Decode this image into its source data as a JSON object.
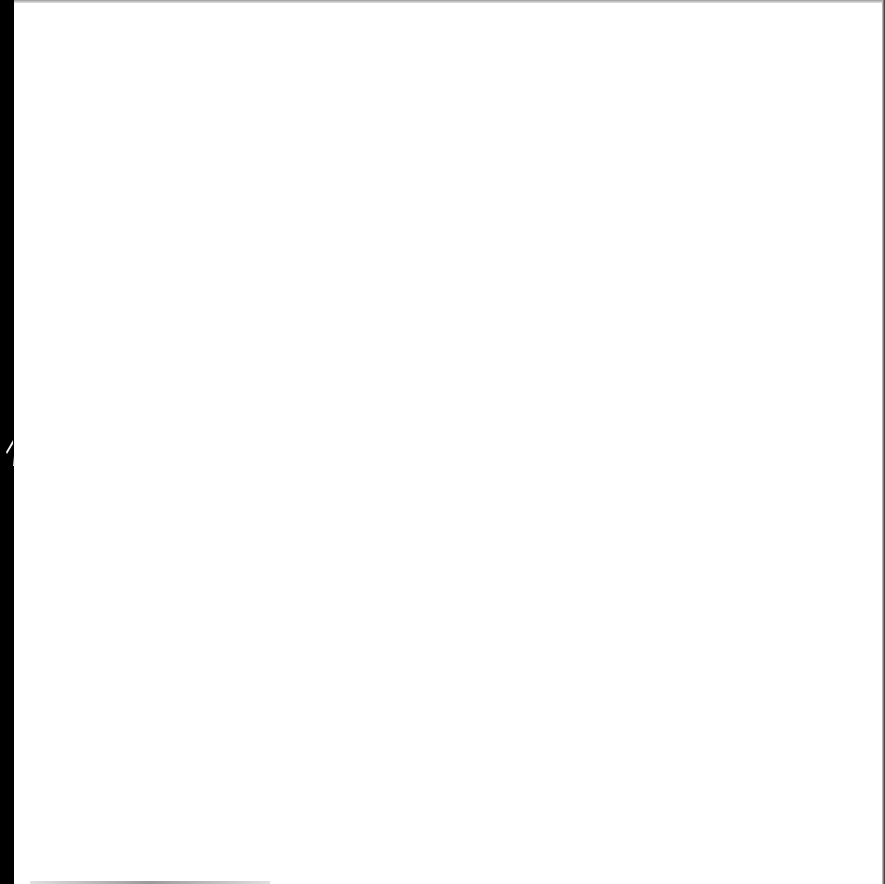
{
  "document": {
    "type": "blank-page",
    "text": "",
    "colors": {
      "paper": "#ffffff",
      "background": "#000000"
    }
  }
}
